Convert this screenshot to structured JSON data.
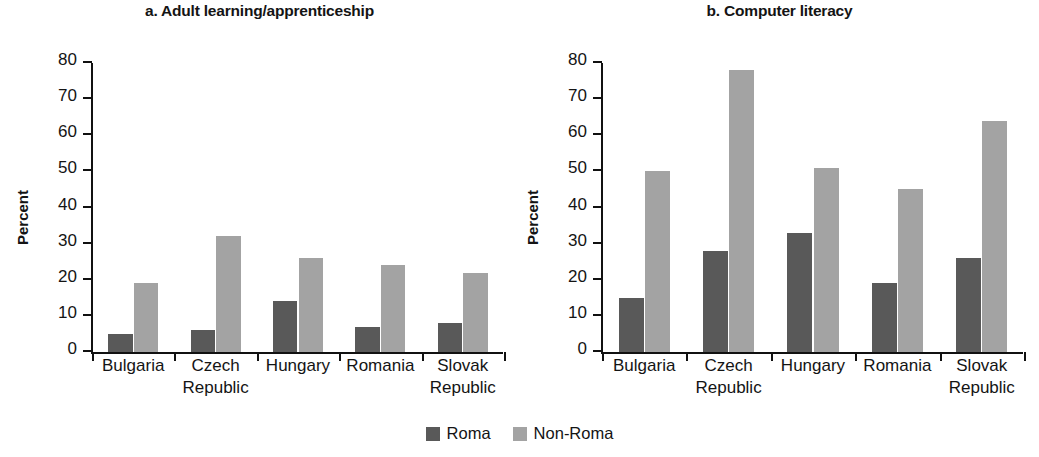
{
  "figure": {
    "legend": [
      {
        "label": "Roma",
        "color": "#595959"
      },
      {
        "label": "Non-Roma",
        "color": "#a3a3a3"
      }
    ]
  },
  "chart_data": [
    {
      "type": "bar",
      "title": "a. Adult learning/apprenticeship",
      "xlabel": "",
      "ylabel": "Percent",
      "ylim": [
        0,
        80
      ],
      "ytick_labels": [
        "0",
        "10",
        "20",
        "30",
        "40",
        "50",
        "60",
        "70",
        "80"
      ],
      "ytick_values": [
        0,
        10,
        20,
        30,
        40,
        50,
        60,
        70,
        80
      ],
      "grid": false,
      "legend_position": "bottom-center",
      "categories": [
        "Bulgaria",
        "Czech Republic",
        "Hungary",
        "Romania",
        "Slovak Republic"
      ],
      "category_lines": [
        [
          "Bulgaria",
          ""
        ],
        [
          "Czech",
          "Republic"
        ],
        [
          "Hungary",
          ""
        ],
        [
          "Romania",
          ""
        ],
        [
          "Slovak",
          "Republic"
        ]
      ],
      "series": [
        {
          "name": "Roma",
          "color": "#595959",
          "values": [
            5,
            6,
            14,
            7,
            8
          ]
        },
        {
          "name": "Non-Roma",
          "color": "#a3a3a3",
          "values": [
            19,
            32,
            26,
            24,
            22
          ]
        }
      ]
    },
    {
      "type": "bar",
      "title": "b. Computer literacy",
      "xlabel": "",
      "ylabel": "Percent",
      "ylim": [
        0,
        80
      ],
      "ytick_labels": [
        "0",
        "10",
        "20",
        "30",
        "40",
        "50",
        "60",
        "70",
        "80"
      ],
      "ytick_values": [
        0,
        10,
        20,
        30,
        40,
        50,
        60,
        70,
        80
      ],
      "grid": false,
      "legend_position": "bottom-center",
      "categories": [
        "Bulgaria",
        "Czech Republic",
        "Hungary",
        "Romania",
        "Slovak Republic"
      ],
      "category_lines": [
        [
          "Bulgaria",
          ""
        ],
        [
          "Czech",
          "Republic"
        ],
        [
          "Hungary",
          ""
        ],
        [
          "Romania",
          ""
        ],
        [
          "Slovak",
          "Republic"
        ]
      ],
      "series": [
        {
          "name": "Roma",
          "color": "#595959",
          "values": [
            15,
            28,
            33,
            19,
            26
          ]
        },
        {
          "name": "Non-Roma",
          "color": "#a3a3a3",
          "values": [
            50,
            78,
            51,
            45,
            64
          ]
        }
      ]
    }
  ]
}
